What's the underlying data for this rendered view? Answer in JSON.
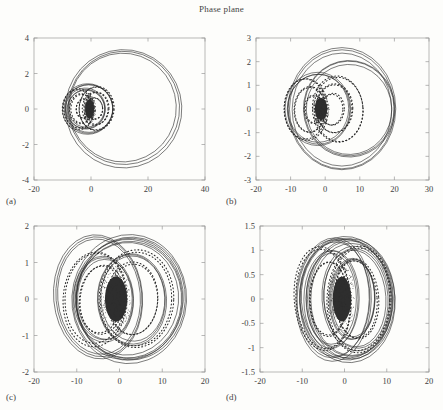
{
  "figure": {
    "title": "Phase plane",
    "background": "#fdfdfb",
    "line_color": "#2b2b2b",
    "axis_color": "#9a9a9a"
  },
  "chart_data": [
    {
      "type": "line",
      "panel": "a",
      "panel_label": "(a)",
      "title": "Phase plane",
      "xlabel": "",
      "ylabel": "",
      "xlim": [
        -20,
        40
      ],
      "ylim": [
        -4,
        4
      ],
      "xticks": [
        -20,
        0,
        20,
        40
      ],
      "xticklabels": [
        "-20",
        "0",
        "20",
        "40"
      ],
      "yticks": [
        -4,
        -2,
        0,
        2,
        4
      ],
      "yticklabels": [
        "-4",
        "-2",
        "0",
        "2",
        "4"
      ],
      "grid": false,
      "legend": false,
      "description": "Large outer solid limit cycle plus nested dotted inner spiral loops converging on a dense attractor blob near origin",
      "series": [
        {
          "name": "outer-cycle",
          "style": "solid",
          "center": [
            11.5,
            0.05
          ],
          "rx": 20.5,
          "ry": 3.35
        },
        {
          "name": "mid-cycle-1",
          "style": "solid",
          "center": [
            -1.0,
            0.0
          ],
          "rx": 9.0,
          "ry": 1.45
        },
        {
          "name": "mid-cycle-2",
          "style": "solid",
          "center": [
            -2.0,
            0.0
          ],
          "rx": 7.0,
          "ry": 1.15
        },
        {
          "name": "dotted-right-1",
          "style": "dotted",
          "center": [
            2.0,
            0.0
          ],
          "rx": 6.2,
          "ry": 1.25
        },
        {
          "name": "dotted-right-2",
          "style": "dotted",
          "center": [
            1.6,
            0.0
          ],
          "rx": 4.6,
          "ry": 0.95
        },
        {
          "name": "dotted-right-3",
          "style": "dotted",
          "center": [
            1.2,
            0.0
          ],
          "rx": 3.0,
          "ry": 0.62
        },
        {
          "name": "dotted-left-1",
          "style": "dotted",
          "center": [
            -4.5,
            0.0
          ],
          "rx": 5.6,
          "ry": 1.15
        },
        {
          "name": "dotted-left-2",
          "style": "dotted",
          "center": [
            -3.6,
            0.0
          ],
          "rx": 4.0,
          "ry": 0.85
        },
        {
          "name": "dotted-left-3",
          "style": "dotted",
          "center": [
            -2.6,
            0.0
          ],
          "rx": 2.6,
          "ry": 0.55
        },
        {
          "name": "attractor-blob",
          "style": "blob",
          "center": [
            -0.5,
            0.0
          ],
          "rx": 1.6,
          "ry": 0.55
        }
      ]
    },
    {
      "type": "line",
      "panel": "b",
      "panel_label": "(b)",
      "title": "",
      "xlabel": "",
      "ylabel": "",
      "xlim": [
        -20,
        30
      ],
      "ylim": [
        -3,
        3
      ],
      "xticks": [
        -20,
        -10,
        0,
        10,
        20,
        30
      ],
      "xticklabels": [
        "-20",
        "-10",
        "0",
        "10",
        "20",
        "30"
      ],
      "yticks": [
        -3,
        -2,
        -1,
        0,
        1,
        2,
        3
      ],
      "yticklabels": [
        "-3",
        "-2",
        "-1",
        "0",
        "1",
        "2",
        "3"
      ],
      "grid": false,
      "legend": false,
      "description": "Two large overlapping solid cycles with nested dotted loops around a central blob",
      "series": [
        {
          "name": "outer-cycle-1",
          "style": "solid",
          "center": [
            5.0,
            0.0
          ],
          "rx": 15.8,
          "ry": 2.62
        },
        {
          "name": "outer-cycle-2",
          "style": "solid",
          "center": [
            7.0,
            0.0
          ],
          "rx": 13.5,
          "ry": 2.08
        },
        {
          "name": "mid-cycle",
          "style": "solid",
          "center": [
            -2.0,
            0.0
          ],
          "rx": 9.5,
          "ry": 1.55
        },
        {
          "name": "dotted-right-1",
          "style": "dotted",
          "center": [
            3.6,
            0.0
          ],
          "rx": 7.4,
          "ry": 1.42
        },
        {
          "name": "dotted-right-2",
          "style": "dotted",
          "center": [
            2.8,
            0.0
          ],
          "rx": 5.4,
          "ry": 1.05
        },
        {
          "name": "dotted-right-3",
          "style": "dotted",
          "center": [
            2.0,
            0.0
          ],
          "rx": 3.4,
          "ry": 0.68
        },
        {
          "name": "dotted-left-1",
          "style": "dotted",
          "center": [
            -5.6,
            0.0
          ],
          "rx": 6.4,
          "ry": 1.32
        },
        {
          "name": "dotted-left-2",
          "style": "dotted",
          "center": [
            -4.4,
            0.0
          ],
          "rx": 4.6,
          "ry": 0.98
        },
        {
          "name": "dotted-left-3",
          "style": "dotted",
          "center": [
            -3.2,
            0.0
          ],
          "rx": 2.8,
          "ry": 0.6
        },
        {
          "name": "attractor-blob",
          "style": "blob",
          "center": [
            -1.2,
            0.0
          ],
          "rx": 1.8,
          "ry": 0.48
        }
      ]
    },
    {
      "type": "line",
      "panel": "c",
      "panel_label": "(c)",
      "title": "",
      "xlabel": "",
      "ylabel": "",
      "xlim": [
        -20,
        20
      ],
      "ylim": [
        -2,
        2
      ],
      "xticks": [
        -20,
        -10,
        0,
        10,
        20
      ],
      "xticklabels": [
        "-20",
        "-10",
        "0",
        "10",
        "20"
      ],
      "yticks": [
        -2,
        -1,
        0,
        1,
        2
      ],
      "yticklabels": [
        "-2",
        "-1",
        "0",
        "1",
        "2"
      ],
      "grid": false,
      "legend": false,
      "description": "Multiple overlapping tilted elliptical orbits with scattered dotted trajectories and a large dense blob at the origin",
      "series": [
        {
          "name": "outer-cycle-1",
          "style": "solid",
          "center": [
            2.5,
            0.0
          ],
          "rx": 13.5,
          "ry": 1.78
        },
        {
          "name": "outer-cycle-2",
          "style": "solid",
          "center": [
            2.0,
            0.0
          ],
          "rx": 13.0,
          "ry": 1.68
        },
        {
          "name": "outer-cycle-3",
          "style": "solid",
          "center": [
            -5.0,
            0.05
          ],
          "rx": 10.5,
          "ry": 1.72
        },
        {
          "name": "mid-cycle-1",
          "style": "solid",
          "center": [
            3.0,
            0.0
          ],
          "rx": 8.2,
          "ry": 1.28
        },
        {
          "name": "mid-cycle-2",
          "style": "solid",
          "center": [
            -3.5,
            0.0
          ],
          "rx": 7.0,
          "ry": 1.18
        },
        {
          "name": "dotted-right-1",
          "style": "dotted",
          "center": [
            4.0,
            0.0
          ],
          "rx": 8.8,
          "ry": 1.35
        },
        {
          "name": "dotted-right-2",
          "style": "dotted",
          "center": [
            3.2,
            0.0
          ],
          "rx": 6.0,
          "ry": 1.0
        },
        {
          "name": "dotted-left-1",
          "style": "dotted",
          "center": [
            -5.5,
            0.0
          ],
          "rx": 7.5,
          "ry": 1.3
        },
        {
          "name": "dotted-left-2",
          "style": "dotted",
          "center": [
            -4.2,
            0.0
          ],
          "rx": 5.2,
          "ry": 0.95
        },
        {
          "name": "attractor-blob",
          "style": "blob",
          "center": [
            -0.8,
            0.0
          ],
          "rx": 2.6,
          "ry": 0.62
        }
      ]
    },
    {
      "type": "line",
      "panel": "d",
      "panel_label": "(d)",
      "title": "",
      "xlabel": "",
      "ylabel": "",
      "xlim": [
        -20,
        20
      ],
      "ylim": [
        -1.5,
        1.5
      ],
      "xticks": [
        -20,
        -10,
        0,
        10,
        20
      ],
      "xticklabels": [
        "-20",
        "-10",
        "0",
        "10",
        "20"
      ],
      "yticks": [
        -1.5,
        -1,
        -0.5,
        0,
        0.5,
        1,
        1.5
      ],
      "yticklabels": [
        "-1.5",
        "-1",
        "-0.5",
        "0",
        "0.5",
        "1",
        "1.5"
      ],
      "grid": false,
      "legend": false,
      "description": "Dense tangle of many overlapping elliptical orbits and dotted trajectories around a vertically elongated blob at the origin",
      "series": [
        {
          "name": "outer-cycle-1",
          "style": "solid",
          "center": [
            0.5,
            0.0
          ],
          "rx": 11.5,
          "ry": 1.32
        },
        {
          "name": "outer-cycle-2",
          "style": "solid",
          "center": [
            1.5,
            0.0
          ],
          "rx": 10.5,
          "ry": 1.25
        },
        {
          "name": "outer-cycle-3",
          "style": "solid",
          "center": [
            -2.5,
            0.0
          ],
          "rx": 9.0,
          "ry": 1.28
        },
        {
          "name": "mid-cycle-1",
          "style": "solid",
          "center": [
            2.5,
            0.0
          ],
          "rx": 8.0,
          "ry": 1.08
        },
        {
          "name": "mid-cycle-2",
          "style": "solid",
          "center": [
            -3.0,
            0.0
          ],
          "rx": 6.5,
          "ry": 1.02
        },
        {
          "name": "mid-cycle-3",
          "style": "solid",
          "center": [
            2.0,
            0.0
          ],
          "rx": 5.5,
          "ry": 0.85
        },
        {
          "name": "dotted-right-1",
          "style": "dotted",
          "center": [
            3.5,
            0.0
          ],
          "rx": 7.6,
          "ry": 1.1
        },
        {
          "name": "dotted-right-2",
          "style": "dotted",
          "center": [
            2.8,
            0.0
          ],
          "rx": 5.2,
          "ry": 0.82
        },
        {
          "name": "dotted-left-1",
          "style": "dotted",
          "center": [
            -5.0,
            0.0
          ],
          "rx": 6.8,
          "ry": 1.08
        },
        {
          "name": "dotted-left-2",
          "style": "dotted",
          "center": [
            -3.8,
            0.0
          ],
          "rx": 4.6,
          "ry": 0.78
        },
        {
          "name": "attractor-blob",
          "style": "blob",
          "center": [
            -0.6,
            0.0
          ],
          "rx": 2.2,
          "ry": 0.46
        }
      ]
    }
  ]
}
